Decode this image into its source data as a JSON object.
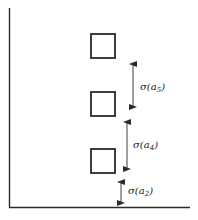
{
  "diagram": {
    "type": "stacked-boxes-spacing",
    "colors": {
      "stroke": "#2a2a2a",
      "background": "#ffffff"
    },
    "axes": {
      "vertical": {
        "x": 9.5,
        "y1": 8,
        "y2": 207.5
      },
      "horizontal": {
        "y": 207.5,
        "x1": 9,
        "x2": 190
      }
    },
    "boxes": [
      {
        "id": "box-top",
        "x": 91,
        "y": 34,
        "w": 24,
        "h": 24
      },
      {
        "id": "box-middle",
        "x": 91,
        "y": 92,
        "w": 24,
        "h": 24
      },
      {
        "id": "box-bottom",
        "x": 91,
        "y": 149,
        "w": 24,
        "h": 24
      }
    ],
    "arrows": [
      {
        "id": "sigma-a5",
        "x": 133,
        "y1": 60,
        "y2": 111,
        "label_base": "σ(a",
        "label_sub": "5",
        "label_close": ")",
        "label_x": 140,
        "label_y": 90
      },
      {
        "id": "sigma-a4",
        "x": 127,
        "y1": 118,
        "y2": 173,
        "label_base": "σ(a",
        "label_sub": "4",
        "label_close": ")",
        "label_x": 133,
        "label_y": 148
      },
      {
        "id": "sigma-a2",
        "x": 121,
        "y1": 178,
        "y2": 207,
        "label_base": "σ(a",
        "label_sub": "2",
        "label_close": ")",
        "label_x": 128,
        "label_y": 194
      }
    ]
  }
}
